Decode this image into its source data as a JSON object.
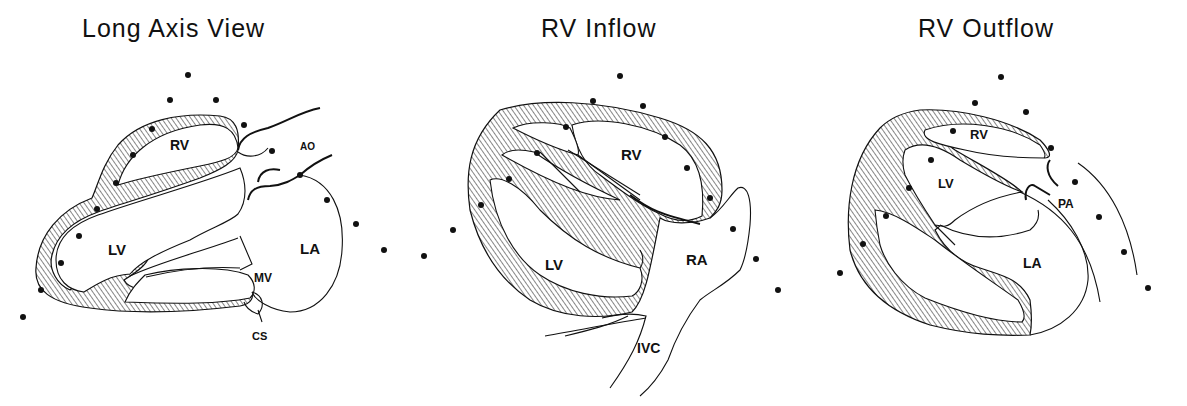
{
  "panels": [
    {
      "title": "Long Axis View",
      "labels": {
        "rv": "RV",
        "ao": "AO",
        "lv": "LV",
        "la": "LA",
        "mv": "MV",
        "cs": "CS"
      }
    },
    {
      "title": "RV Inflow",
      "labels": {
        "rv": "RV",
        "lv": "LV",
        "ra": "RA",
        "ivc": "IVC"
      }
    },
    {
      "title": "RV Outflow",
      "labels": {
        "rv": "RV",
        "lv": "LV",
        "pa": "PA",
        "la": "LA"
      }
    }
  ],
  "colors": {
    "ink": "#111111",
    "background": "#ffffff"
  }
}
